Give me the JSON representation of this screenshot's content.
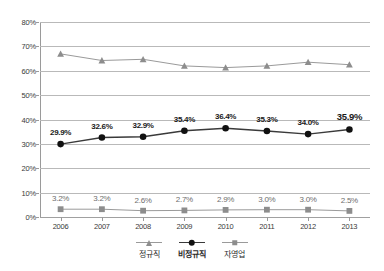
{
  "chart_data": {
    "type": "line",
    "title": "",
    "xlabel": "",
    "ylabel": "",
    "categories": [
      "2006",
      "2007",
      "2008",
      "2009",
      "2010",
      "2011",
      "2012",
      "2013"
    ],
    "ylim": [
      0,
      80
    ],
    "ytick_labels": [
      "0%",
      "10%",
      "20%",
      "30%",
      "40%",
      "50%",
      "60%",
      "70%",
      "80%"
    ],
    "ytick_values": [
      0,
      10,
      20,
      30,
      40,
      50,
      60,
      70,
      80
    ],
    "grid": true,
    "legend_position": "bottom",
    "series": [
      {
        "name": "정규직",
        "marker": "triangle",
        "color": "#8d8d8d",
        "line_color": "#9a9a9a",
        "labels_shown": false,
        "values": [
          66.9,
          64.2,
          64.7,
          62.0,
          61.3,
          62.0,
          63.5,
          62.5
        ],
        "value_labels": [
          "",
          "",
          "",
          "",
          "",
          "",
          "",
          ""
        ]
      },
      {
        "name": "비정규직",
        "marker": "circle",
        "color": "#111111",
        "line_color": "#3a3a3a",
        "labels_shown": true,
        "values": [
          29.9,
          32.6,
          32.9,
          35.4,
          36.4,
          35.3,
          34.0,
          35.9
        ],
        "value_labels": [
          "29.9%",
          "32.6%",
          "32.9%",
          "35.4%",
          "36.4%",
          "35.3%",
          "34.0%",
          "35.9%"
        ]
      },
      {
        "name": "자영업",
        "marker": "square",
        "color": "#8d8d8d",
        "line_color": "#9a9a9a",
        "labels_shown": true,
        "values": [
          3.2,
          3.2,
          2.6,
          2.7,
          2.9,
          3.0,
          3.0,
          2.5
        ],
        "value_labels": [
          "3.2%",
          "3.2%",
          "2.6%",
          "2.7%",
          "2.9%",
          "3.0%",
          "3.0%",
          "2.5%"
        ]
      }
    ]
  },
  "legend": {
    "items": [
      {
        "label": "정규직",
        "symbol": "triangle-marker-icon"
      },
      {
        "label": "비정규직",
        "symbol": "circle-marker-icon"
      },
      {
        "label": "자영업",
        "symbol": "square-marker-icon"
      }
    ]
  },
  "colors": {
    "grid": "#b9b9b9",
    "axis": "#9a9a9a",
    "background": "#ffffff",
    "series_regular": "#8d8d8d",
    "series_nonregular": "#111111",
    "series_selfemployed": "#8d8d8d"
  }
}
